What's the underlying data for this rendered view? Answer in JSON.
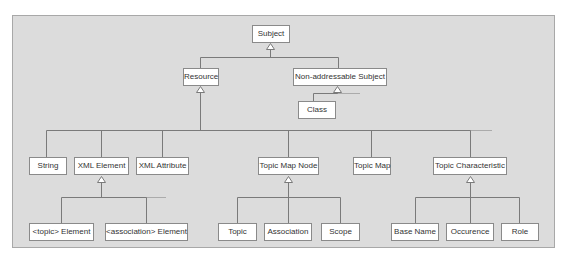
{
  "nodes": {
    "subject": "Subject",
    "resource": "Resource",
    "non_addressable_subject": "Non-addressable Subject",
    "class": "Class",
    "string": "String",
    "xml_element": "XML Element",
    "xml_attribute": "XML Attribute",
    "topic_map_node": "Topic Map Node",
    "topic_map": "Topic Map",
    "topic_characteristic": "Topic Characteristic",
    "topic_element": "<topic> Element",
    "association_element": "<association> Element",
    "topic": "Topic",
    "association": "Association",
    "scope": "Scope",
    "base_name": "Base Name",
    "occurence": "Occurence",
    "role": "Role"
  },
  "hierarchy": [
    {
      "parent": "Subject",
      "children": [
        "Resource",
        "Non-addressable Subject"
      ]
    },
    {
      "parent": "Non-addressable Subject",
      "children": [
        "Class"
      ]
    },
    {
      "parent": "Resource",
      "children": [
        "String",
        "XML Element",
        "XML Attribute",
        "Topic Map Node",
        "Topic Map",
        "Topic Characteristic"
      ]
    },
    {
      "parent": "XML Element",
      "children": [
        "<topic> Element",
        "<association> Element"
      ]
    },
    {
      "parent": "Topic Map Node",
      "children": [
        "Topic",
        "Association",
        "Scope"
      ]
    },
    {
      "parent": "Topic Characteristic",
      "children": [
        "Base Name",
        "Occurence",
        "Role"
      ]
    }
  ],
  "colors": {
    "panel_bg": "#dcdcdc",
    "box_bg": "#ffffff",
    "line": "#7a7a7a"
  }
}
